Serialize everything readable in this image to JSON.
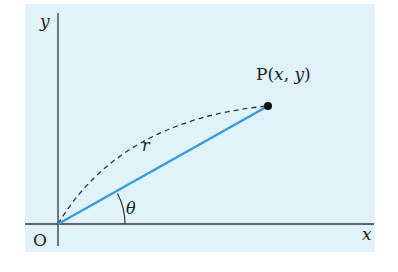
{
  "diagram": {
    "type": "polar-coordinate-figure",
    "colors": {
      "background": "#dff3f9",
      "axis": "#333333",
      "radius_segment": "#3a9bdc",
      "arc": "#333333",
      "point": "#111111"
    },
    "labels": {
      "y_axis": "y",
      "x_axis": "x",
      "origin": "O",
      "point_name": "P",
      "point_coords_open": "(",
      "point_x": "x",
      "point_comma": ", ",
      "point_y": "y",
      "point_coords_close": ")",
      "radius": "r",
      "angle": "θ"
    },
    "geometry": {
      "origin": [
        58,
        224
      ],
      "point": [
        268,
        106
      ]
    }
  }
}
